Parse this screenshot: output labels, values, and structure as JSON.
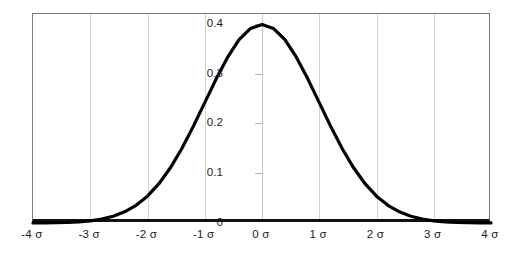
{
  "chart_data": {
    "type": "line",
    "title": "",
    "subtitle": "",
    "xlabel": "",
    "ylabel": "",
    "grid": "vertical gridlines at each sigma",
    "legend": "none",
    "xlim": [
      -4,
      4
    ],
    "ylim": [
      0,
      0.42
    ],
    "x_tick_labels": [
      "-4 σ",
      "-3 σ",
      "-2 σ",
      "-1 σ",
      "0 σ",
      "1 σ",
      "2 σ",
      "3 σ",
      "4 σ"
    ],
    "x_tick_values": [
      -4,
      -3,
      -2,
      -1,
      0,
      1,
      2,
      3,
      4
    ],
    "y_tick_labels": [
      "0",
      "0.1",
      "0.2",
      "0.3",
      "0.4"
    ],
    "y_tick_values": [
      0,
      0.1,
      0.2,
      0.3,
      0.4
    ],
    "series": [
      {
        "name": "normal pdf",
        "color": "#000000",
        "x": [
          -4,
          -3.8,
          -3.6,
          -3.4,
          -3.2,
          -3,
          -2.8,
          -2.6,
          -2.4,
          -2.2,
          -2,
          -1.8,
          -1.6,
          -1.4,
          -1.2,
          -1,
          -0.8,
          -0.6,
          -0.4,
          -0.2,
          0,
          0.2,
          0.4,
          0.6,
          0.8,
          1,
          1.2,
          1.4,
          1.6,
          1.8,
          2,
          2.2,
          2.4,
          2.6,
          2.8,
          3,
          3.2,
          3.4,
          3.6,
          3.8,
          4
        ],
        "values": [
          0.0001,
          0.0003,
          0.0006,
          0.0012,
          0.0024,
          0.0044,
          0.0079,
          0.0136,
          0.0224,
          0.0355,
          0.054,
          0.079,
          0.1109,
          0.1497,
          0.1942,
          0.242,
          0.2897,
          0.3332,
          0.3683,
          0.391,
          0.3989,
          0.391,
          0.3683,
          0.3332,
          0.2897,
          0.242,
          0.1942,
          0.1497,
          0.1109,
          0.079,
          0.054,
          0.0355,
          0.0224,
          0.0136,
          0.0079,
          0.0044,
          0.0024,
          0.0012,
          0.0006,
          0.0003,
          0.0001
        ]
      }
    ],
    "peak": {
      "x": 0,
      "y": 0.4
    },
    "colors": {
      "curve": "#000000",
      "gridline": "#d3d3d3",
      "border": "#7a7a7a",
      "axis": "#111111",
      "background": "#ffffff",
      "text": "#1b1b1b"
    }
  }
}
